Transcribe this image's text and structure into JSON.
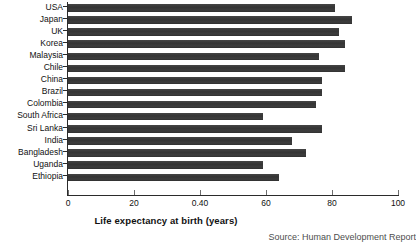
{
  "chart_data": {
    "type": "bar",
    "orientation": "horizontal",
    "title": "",
    "xlabel": "Life expectancy at birth (years)",
    "ylabel": "",
    "xlim": [
      0,
      100
    ],
    "xticks": [
      0,
      20,
      40,
      60,
      80,
      100
    ],
    "xtick_labels": [
      "0",
      "20",
      "0.40",
      "60",
      "80",
      "100"
    ],
    "grid": false,
    "legend": false,
    "bar_color": "#3a3a3a",
    "categories": [
      "USA",
      "Japan",
      "UK",
      "Korea",
      "Malaysia",
      "Chile",
      "China",
      "Brazil",
      "Colombia",
      "South Africa",
      "Sri Lanka",
      "India",
      "Bangladesh",
      "Uganda",
      "Ethiopia"
    ],
    "values": [
      81,
      86,
      82,
      84,
      76,
      84,
      77,
      77,
      75,
      59,
      77,
      68,
      72,
      59,
      64
    ],
    "source": "Source: Human Development Report"
  }
}
